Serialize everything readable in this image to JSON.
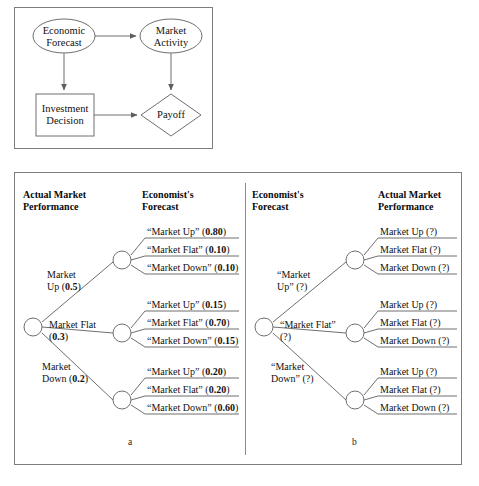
{
  "figure": {
    "influence_diagram": {
      "nodes": [
        {
          "id": "economic-forecast",
          "type": "oval",
          "line1": "Economic",
          "line2": "Forecast"
        },
        {
          "id": "market-activity",
          "type": "oval",
          "line1": "Market",
          "line2": "Activity"
        },
        {
          "id": "investment-decision",
          "type": "rect",
          "line1": "Investment",
          "line2": "Decision"
        },
        {
          "id": "payoff",
          "type": "diamond",
          "line1": "Payoff",
          "line2": ""
        }
      ],
      "arcs": [
        {
          "from": "economic-forecast",
          "to": "market-activity"
        },
        {
          "from": "economic-forecast",
          "to": "investment-decision"
        },
        {
          "from": "market-activity",
          "to": "payoff"
        },
        {
          "from": "investment-decision",
          "to": "payoff"
        }
      ]
    },
    "tree_a": {
      "caption": "a",
      "headers": [
        {
          "line1": "Actual Market",
          "line2": "Performance"
        },
        {
          "line1": "Economist's",
          "line2": "Forecast"
        }
      ],
      "first_stage": [
        {
          "label_line1": "Market",
          "label_line2": "Up (",
          "prob": "0.5",
          "tail": ")"
        },
        {
          "label_line1": "Market Flat",
          "label_line2": "(",
          "prob": "0.3",
          "tail": ")"
        },
        {
          "label_line1": "Market",
          "label_line2": "Down (",
          "prob": "0.2",
          "tail": ")"
        }
      ],
      "second_stage": [
        [
          {
            "label": "“Market Up” (",
            "prob": "0.80",
            "tail": ")"
          },
          {
            "label": "“Market Flat” (",
            "prob": "0.10",
            "tail": ")"
          },
          {
            "label": "“Market Down” (",
            "prob": "0.10",
            "tail": ")"
          }
        ],
        [
          {
            "label": "“Market Up” (",
            "prob": "0.15",
            "tail": ")"
          },
          {
            "label": "“Market Flat” (",
            "prob": "0.70",
            "tail": ")"
          },
          {
            "label": "“Market Down” (",
            "prob": "0.15",
            "tail": ")"
          }
        ],
        [
          {
            "label": "“Market Up” (",
            "prob": "0.20",
            "tail": ")"
          },
          {
            "label": "“Market Flat” (",
            "prob": "0.20",
            "tail": ")"
          },
          {
            "label": "“Market Down” (",
            "prob": "0.60",
            "tail": ")"
          }
        ]
      ]
    },
    "tree_b": {
      "caption": "b",
      "headers": [
        {
          "line1": "Economist's",
          "line2": "Forecast"
        },
        {
          "line1": "Actual Market",
          "line2": "Performance"
        }
      ],
      "first_stage": [
        {
          "label_line1": "“Market",
          "label_line2": "Up” (?)"
        },
        {
          "label_line1": "“Market Flat”",
          "label_line2": "(?)"
        },
        {
          "label_line1": "“Market",
          "label_line2": "Down” (?)"
        }
      ],
      "second_stage": [
        [
          {
            "label": "Market Up (?)"
          },
          {
            "label": "Market Flat (?)"
          },
          {
            "label": "Market Down (?)"
          }
        ],
        [
          {
            "label": "Market Up (?)"
          },
          {
            "label": "Market Flat (?)"
          },
          {
            "label": "Market Down (?)"
          }
        ],
        [
          {
            "label": "Market Up (?)"
          },
          {
            "label": "Market Flat (?)"
          },
          {
            "label": "Market Down (?)"
          }
        ]
      ]
    },
    "colors": {
      "stroke": "#6f6f6f",
      "panel_border": "#7d7d7d",
      "text": "#111111",
      "background": "#ffffff"
    }
  }
}
